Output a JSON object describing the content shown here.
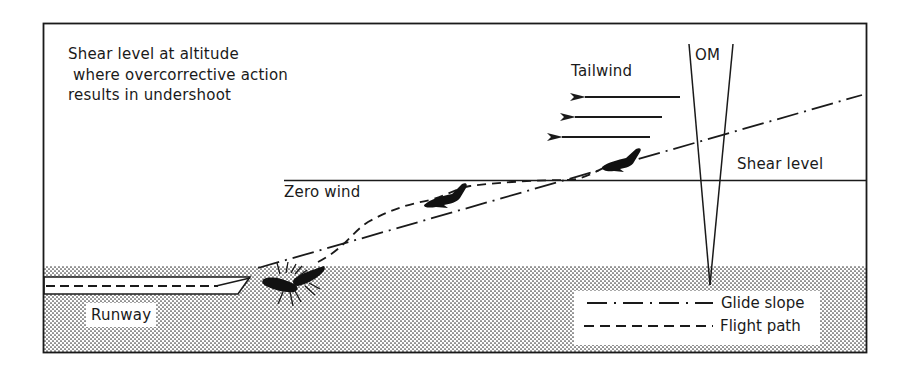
{
  "figure": {
    "annotation_lines": [
      "Shear level at altitude",
      " where overcorrective action",
      "results in undershoot"
    ],
    "labels": {
      "tailwind": "Tailwind",
      "outer_marker": "OM",
      "shear_level": "Shear level",
      "zero_wind": "Zero wind",
      "runway": "Runway"
    },
    "legend": [
      {
        "style": "dash-dot",
        "label": "Glide slope"
      },
      {
        "style": "dashed",
        "label": "Flight path"
      }
    ],
    "elements": {
      "tailwind_arrows": 3,
      "aircraft_silhouettes": [
        "in tailwind above shear level",
        "below shear level after overcorrection",
        "crash short of runway"
      ]
    },
    "colors": {
      "ink": "#1a1a1a",
      "background": "#ffffff",
      "ground_stipple": "#3a3a3a"
    }
  }
}
